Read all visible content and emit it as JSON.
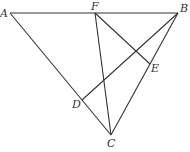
{
  "diagram": {
    "type": "geometry",
    "points": {
      "A": {
        "label": "A",
        "x": 10,
        "y": 13,
        "lx": 0,
        "ly": 17
      },
      "F": {
        "label": "F",
        "x": 95,
        "y": 13,
        "lx": 91,
        "ly": 10
      },
      "B": {
        "label": "B",
        "x": 178,
        "y": 13,
        "lx": 180,
        "ly": 12
      },
      "E": {
        "label": "E",
        "x": 150,
        "y": 64,
        "lx": 151,
        "ly": 72
      },
      "D": {
        "label": "D",
        "x": 82,
        "y": 100,
        "lx": 72,
        "ly": 108
      },
      "C": {
        "label": "C",
        "x": 111,
        "y": 135,
        "lx": 107,
        "ly": 147
      }
    },
    "segments": [
      [
        "A",
        "B"
      ],
      [
        "A",
        "C"
      ],
      [
        "B",
        "C"
      ],
      [
        "F",
        "C"
      ],
      [
        "F",
        "E"
      ],
      [
        "B",
        "D"
      ]
    ],
    "color": "#333333"
  }
}
